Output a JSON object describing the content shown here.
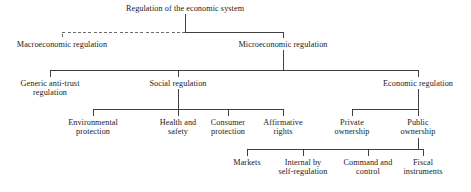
{
  "diagram": {
    "title": "Regulation of the economic system",
    "type": "hierarchy-tree",
    "colors": {
      "text": "#1a1a1a",
      "edge_solid": "#2b2b2b",
      "edge_dashed": "#5a5a5a",
      "background": "#ffffff"
    },
    "nodes": [
      {
        "id": "root",
        "label": "Regulation of the economic system",
        "level": 0,
        "cx": 185,
        "top": 4,
        "width": 160,
        "lines": 1
      },
      {
        "id": "macro",
        "label": "Macroeconomic regulation",
        "level": 1,
        "cx": 62,
        "top": 40,
        "width": 120,
        "lines": 1,
        "edge_style": "dashed"
      },
      {
        "id": "micro",
        "label": "Microeconomic regulation",
        "level": 1,
        "cx": 283,
        "top": 40,
        "width": 120,
        "lines": 1,
        "edge_style": "solid"
      },
      {
        "id": "antitrust",
        "label": "Generic anti-trust\nregulation",
        "level": 2,
        "cx": 50,
        "top": 79,
        "width": 94,
        "lines": 2,
        "edge_style": "solid"
      },
      {
        "id": "social",
        "label": "Social regulation",
        "level": 2,
        "cx": 178,
        "top": 79,
        "width": 94,
        "lines": 1,
        "edge_style": "solid"
      },
      {
        "id": "economic",
        "label": "Economic regulation",
        "level": 2,
        "cx": 418,
        "top": 79,
        "width": 104,
        "lines": 1,
        "edge_style": "solid"
      },
      {
        "id": "environmental",
        "label": "Environmental\nprotection",
        "level": 3,
        "cx": 93,
        "top": 118,
        "width": 78,
        "lines": 2,
        "edge_style": "solid"
      },
      {
        "id": "health",
        "label": "Health and\nsafety",
        "level": 3,
        "cx": 178,
        "top": 118,
        "width": 60,
        "lines": 2,
        "edge_style": "solid"
      },
      {
        "id": "consumer",
        "label": "Consumer\nprotection",
        "level": 3,
        "cx": 228,
        "top": 118,
        "width": 56,
        "lines": 2,
        "edge_style": "solid"
      },
      {
        "id": "affirmative",
        "label": "Affirmative\nrights",
        "level": 3,
        "cx": 283,
        "top": 118,
        "width": 58,
        "lines": 2,
        "edge_style": "solid"
      },
      {
        "id": "private",
        "label": "Private\nownership",
        "level": 3,
        "cx": 352,
        "top": 118,
        "width": 58,
        "lines": 2,
        "edge_style": "solid"
      },
      {
        "id": "public",
        "label": "Public\nownership",
        "level": 3,
        "cx": 418,
        "top": 118,
        "width": 58,
        "lines": 2,
        "edge_style": "solid"
      },
      {
        "id": "markets",
        "label": "Markets",
        "level": 4,
        "cx": 247,
        "top": 158,
        "width": 54,
        "lines": 1,
        "edge_style": "solid"
      },
      {
        "id": "internal",
        "label": "Internal by\nself-regulation",
        "level": 4,
        "cx": 303,
        "top": 158,
        "width": 72,
        "lines": 2,
        "edge_style": "solid"
      },
      {
        "id": "command",
        "label": "Command and\ncontrol",
        "level": 4,
        "cx": 368,
        "top": 158,
        "width": 70,
        "lines": 2,
        "edge_style": "solid"
      },
      {
        "id": "fiscal",
        "label": "Fiscal\ninstruments",
        "level": 4,
        "cx": 423,
        "top": 158,
        "width": 62,
        "lines": 2,
        "edge_style": "solid"
      }
    ],
    "edges": [
      {
        "id": "root-stem",
        "from": "root",
        "to": "split-1",
        "style": "solid",
        "d": "M185 14 L185 32"
      },
      {
        "id": "root-to-macro",
        "from": "root",
        "to": "macro",
        "style": "dashed",
        "d": "M185 32 L62 32 L62 38"
      },
      {
        "id": "root-to-micro",
        "from": "root",
        "to": "micro",
        "style": "solid",
        "d": "M185 32 L283 32 L283 38"
      },
      {
        "id": "micro-stem",
        "from": "micro",
        "to": "split-2",
        "style": "solid",
        "d": "M283 50 L283 70"
      },
      {
        "id": "micro-to-anti",
        "from": "micro",
        "to": "antitrust",
        "style": "solid",
        "d": "M283 70 L50 70 L50 77"
      },
      {
        "id": "micro-to-social",
        "from": "micro",
        "to": "social",
        "style": "solid",
        "d": "M178 70 L178 77"
      },
      {
        "id": "micro-to-econ",
        "from": "micro",
        "to": "economic",
        "style": "solid",
        "d": "M283 70 L418 70 L418 77"
      },
      {
        "id": "social-stem",
        "from": "social",
        "to": "split-3",
        "style": "solid",
        "d": "M178 89 L178 109"
      },
      {
        "id": "social-to-env",
        "from": "social",
        "to": "environmental",
        "style": "solid",
        "d": "M178 109 L93 109 L93 116"
      },
      {
        "id": "social-to-hs",
        "from": "social",
        "to": "health",
        "style": "solid",
        "d": "M178 109 L178 116"
      },
      {
        "id": "social-to-cons",
        "from": "social",
        "to": "consumer",
        "style": "solid",
        "d": "M178 109 L228 109 L228 116"
      },
      {
        "id": "social-to-aff",
        "from": "social",
        "to": "affirmative",
        "style": "solid",
        "d": "M228 109 L283 109 L283 116"
      },
      {
        "id": "econ-stem",
        "from": "economic",
        "to": "split-4",
        "style": "solid",
        "d": "M418 89 L418 109"
      },
      {
        "id": "econ-to-priv",
        "from": "economic",
        "to": "private",
        "style": "solid",
        "d": "M418 109 L352 109 L352 116"
      },
      {
        "id": "econ-to-pub",
        "from": "economic",
        "to": "public",
        "style": "solid",
        "d": "M418 109 L418 116"
      },
      {
        "id": "public-stem",
        "from": "public",
        "to": "split-5",
        "style": "solid",
        "d": "M418 138 L418 149"
      },
      {
        "id": "public-to-mkt",
        "from": "public",
        "to": "markets",
        "style": "solid",
        "d": "M418 149 L247 149 L247 156"
      },
      {
        "id": "public-to-int",
        "from": "public",
        "to": "internal",
        "style": "solid",
        "d": "M303 149 L303 156"
      },
      {
        "id": "public-to-cmd",
        "from": "public",
        "to": "command",
        "style": "solid",
        "d": "M368 149 L368 156"
      },
      {
        "id": "public-to-fis",
        "from": "public",
        "to": "fiscal",
        "style": "solid",
        "d": "M418 149 L423 149 L423 156"
      }
    ]
  }
}
